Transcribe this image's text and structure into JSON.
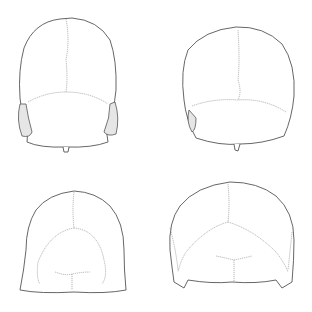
{
  "figure": {
    "panels": [
      {
        "name": "top-left",
        "view": "superior view, skull 1"
      },
      {
        "name": "top-right",
        "view": "superior view, skull 2"
      },
      {
        "name": "bottom-left",
        "view": "posterior view, skull 1"
      },
      {
        "name": "bottom-right",
        "view": "posterior view, skull 2"
      }
    ],
    "colors": {
      "background": "#ffffff",
      "line": "#555555",
      "suture": "#888888"
    }
  }
}
